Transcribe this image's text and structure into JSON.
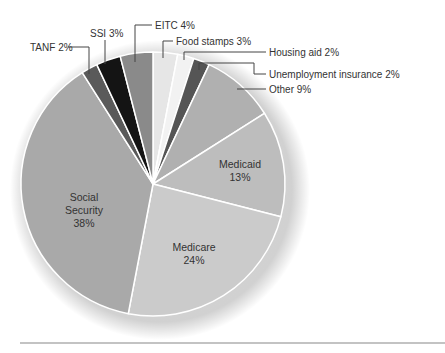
{
  "chart_data": {
    "type": "pie",
    "title": "",
    "start_angle_deg": 0,
    "direction": "clockwise",
    "slices": [
      {
        "label": "Food stamps",
        "value": 3,
        "color": "#e6e6e6",
        "display": "Food stamps 3%"
      },
      {
        "label": "Housing aid",
        "value": 2,
        "color": "#f2f2f2",
        "display": "Housing aid 2%"
      },
      {
        "label": "Unemployment insurance",
        "value": 2,
        "color": "#555555",
        "display": "Unemployment insurance 2%"
      },
      {
        "label": "Other",
        "value": 9,
        "color": "#b0b0b0",
        "display": "Other 9%"
      },
      {
        "label": "Medicaid",
        "value": 13,
        "color": "#bdbdbd",
        "display": "Medicaid 13%"
      },
      {
        "label": "Medicare",
        "value": 24,
        "color": "#cbcbcb",
        "display": "Medicare 24%"
      },
      {
        "label": "Social Security",
        "value": 38,
        "color": "#a9a9a9",
        "display": "Social Security 38%"
      },
      {
        "label": "TANF",
        "value": 2,
        "color": "#5a5a5a",
        "display": "TANF 2%"
      },
      {
        "label": "SSI",
        "value": 3,
        "color": "#141414",
        "display": "SSI 3%"
      },
      {
        "label": "EITC",
        "value": 4,
        "color": "#8a8a8a",
        "display": "EITC 4%"
      }
    ],
    "legend": "none",
    "labels_position": "callouts and inside"
  },
  "labels": {
    "food_stamps": "Food stamps 3%",
    "housing_aid": "Housing aid 2%",
    "unemployment": "Unemployment insurance 2%",
    "other": "Other 9%",
    "tanf": "TANF 2%",
    "ssi": "SSI 3%",
    "eitc": "EITC 4%",
    "medicaid_name": "Medicaid",
    "medicaid_pct": "13%",
    "medicare_name": "Medicare",
    "medicare_pct": "24%",
    "ss_name_1": "Social",
    "ss_name_2": "Security",
    "ss_pct": "38%"
  }
}
